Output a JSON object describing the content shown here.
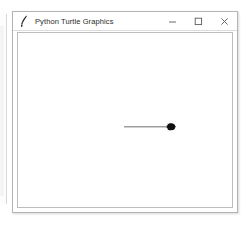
{
  "window": {
    "title": "Python Turtle Graphics",
    "icon": "python-feather-icon",
    "controls": {
      "minimize_label": "Minimize",
      "maximize_label": "Maximize",
      "close_label": "Close"
    }
  },
  "canvas": {
    "background_color": "#ffffff",
    "pen_color": "#6b6b6b",
    "turtle_color": "#101010",
    "drawing": {
      "type": "line",
      "description": "horizontal line drawn left to right ending at turtle",
      "start_x": 124,
      "start_y": 120,
      "end_x": 172,
      "end_y": 120
    },
    "turtle": {
      "x": 174,
      "y": 120,
      "heading_degrees": 0,
      "shape": "turtle"
    }
  }
}
